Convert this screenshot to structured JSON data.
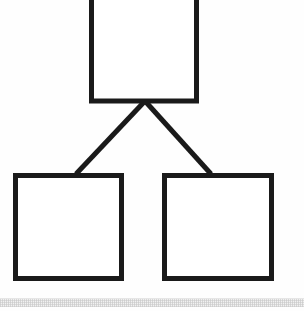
{
  "document": {
    "title": "Hierarchy Diagram",
    "kind": "line-drawing",
    "background_color": "#fefefe",
    "stroke_color": "#1a1a1a",
    "width": 304,
    "height": 311
  },
  "diagram": {
    "type": "tree",
    "orientation": "top-down",
    "node_count": 3,
    "edge_count": 2,
    "nodes": [
      {
        "id": "root",
        "role": "parent",
        "label": "",
        "shape": "rectangle",
        "x": 89,
        "y": -12,
        "width": 110,
        "height": 115,
        "cropped_at_top": true,
        "fill": "#ffffff",
        "stroke": "#1a1a1a",
        "stroke_width": 5
      },
      {
        "id": "child-left",
        "role": "child",
        "label": "",
        "shape": "rectangle",
        "x": 13,
        "y": 173,
        "width": 111,
        "height": 108,
        "cropped_at_top": false,
        "fill": "#ffffff",
        "stroke": "#1a1a1a",
        "stroke_width": 5
      },
      {
        "id": "child-right",
        "role": "child",
        "label": "",
        "shape": "rectangle",
        "x": 162,
        "y": 173,
        "width": 112,
        "height": 108,
        "cropped_at_top": false,
        "fill": "#ffffff",
        "stroke": "#1a1a1a",
        "stroke_width": 5
      }
    ],
    "edges": [
      {
        "id": "edge-root-left",
        "from": "root",
        "to": "child-left",
        "style": "straight-line",
        "arrowhead": "none",
        "x1": 145,
        "y1": 101,
        "x2": 76,
        "y2": 174,
        "stroke": "#1a1a1a",
        "stroke_width": 5
      },
      {
        "id": "edge-root-right",
        "from": "root",
        "to": "child-right",
        "style": "straight-line",
        "arrowhead": "none",
        "x1": 145,
        "y1": 101,
        "x2": 211,
        "y2": 174,
        "stroke": "#1a1a1a",
        "stroke_width": 5
      }
    ]
  },
  "scan_artifacts": {
    "bottom_band": {
      "present": true,
      "y": 299,
      "height": 8,
      "color": "#f1f1f1"
    }
  }
}
